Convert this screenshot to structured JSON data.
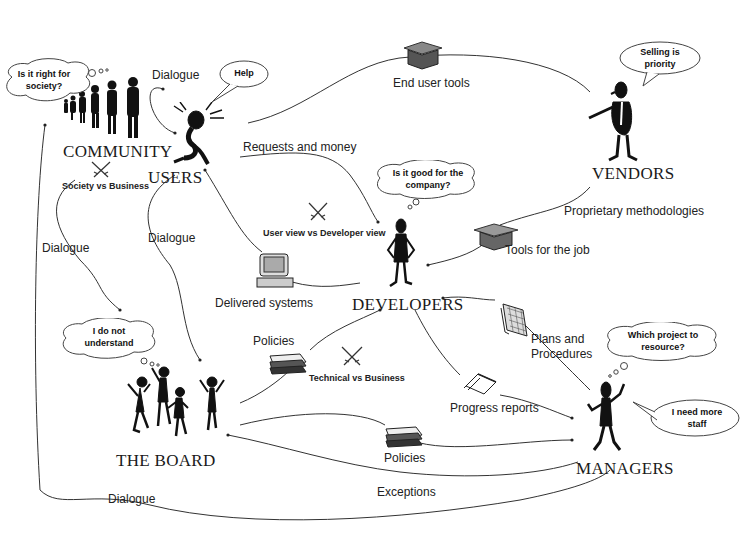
{
  "diagram": {
    "type": "stakeholder relationship diagram",
    "actors": {
      "community": "COMMUNITY",
      "users": "USERS",
      "vendors": "VENDORS",
      "developers": "DEVELOPERS",
      "board": "THE BOARD",
      "managers": "MANAGERS"
    },
    "thoughts": {
      "community": "Is it right for society?",
      "users": "Help",
      "vendors": "Selling is priority",
      "developers": "Is it good for the company?",
      "board": "I do not understand",
      "managers_thought": "Which project to resource?",
      "managers_speech": "I need more staff"
    },
    "conflicts": {
      "society_business": "Society vs Business",
      "user_developer": "User view vs Developer view",
      "technical_business": "Technical vs Business"
    },
    "flows": {
      "dialogue_community_users": "Dialogue",
      "end_user_tools": "End user tools",
      "requests_money": "Requests and money",
      "proprietary_methodologies": "Proprietary  methodologies",
      "tools_for_job": "Tools for the job",
      "dialogue_community_board": "Dialogue",
      "dialogue_users_board": "Dialogue",
      "delivered_systems": "Delivered systems",
      "policies_board_developers": "Policies",
      "plans_procedures": "Plans and Procedures",
      "progress_reports": "Progress reports",
      "policies_board_managers": "Policies",
      "exceptions": "Exceptions",
      "dialogue_bottom": "Dialogue"
    }
  }
}
